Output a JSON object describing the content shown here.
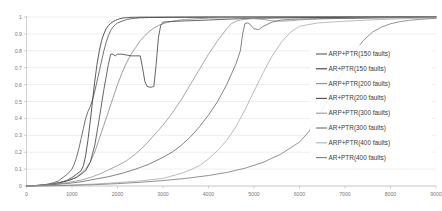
{
  "chart_data": {
    "type": "line",
    "title": "",
    "xlabel": "",
    "ylabel": "",
    "xlim": [
      0,
      9000
    ],
    "ylim": [
      0,
      1
    ],
    "grid": true,
    "legend_position": "right-inside",
    "xticks": [
      0,
      1000,
      2000,
      3000,
      4000,
      5000,
      6000,
      7000,
      8000,
      9000
    ],
    "xtick_labels": [
      "0",
      "1000",
      "2000",
      "3000",
      "4000",
      "5000",
      "6000",
      "7000",
      "8000",
      "9000"
    ],
    "yticks": [
      0,
      0.1,
      0.2,
      0.3,
      0.4,
      0.5,
      0.6,
      0.7,
      0.8,
      0.9,
      1
    ],
    "ytick_labels": [
      "0",
      "0.1",
      "0.2",
      "0.3",
      "0.4",
      "0.5",
      "0.6",
      "0.7",
      "0.8",
      "0.9",
      "1"
    ],
    "series": [
      {
        "name": "ARP+PTR(150 faults)",
        "color": "#5a5a5a",
        "x": [
          0,
          150,
          300,
          450,
          600,
          700,
          800,
          900,
          1000,
          1050,
          1100,
          1150,
          1200,
          1250,
          1300,
          1350,
          1400,
          1450,
          1500,
          1550,
          1600,
          1650,
          1700,
          1750,
          1800,
          1850,
          1900,
          1950,
          2000,
          2100,
          2200,
          2300,
          2400,
          2500,
          2600,
          2700,
          2800,
          3000,
          3500,
          4000,
          4500,
          5000,
          6000,
          7000,
          8000,
          9000
        ],
        "y": [
          0,
          0.002,
          0.005,
          0.01,
          0.02,
          0.03,
          0.05,
          0.07,
          0.1,
          0.13,
          0.17,
          0.22,
          0.28,
          0.34,
          0.4,
          0.44,
          0.47,
          0.51,
          0.56,
          0.62,
          0.68,
          0.74,
          0.8,
          0.85,
          0.89,
          0.92,
          0.94,
          0.955,
          0.965,
          0.975,
          0.985,
          0.99,
          0.993,
          0.995,
          0.996,
          0.997,
          0.997,
          0.998,
          0.998,
          0.999,
          0.999,
          0.999,
          1,
          1,
          1,
          1
        ]
      },
      {
        "name": "AR+PTR(150 faults)",
        "color": "#3c3c3c",
        "x": [
          0,
          200,
          400,
          600,
          800,
          900,
          1000,
          1100,
          1200,
          1250,
          1300,
          1350,
          1400,
          1450,
          1500,
          1550,
          1600,
          1650,
          1700,
          1750,
          1800,
          1850,
          1900,
          1950,
          2000,
          2050,
          2100,
          2150,
          2200,
          2250,
          2300,
          2350,
          2400,
          2500,
          2600,
          2700,
          2800,
          3000,
          3500,
          4000,
          4500,
          5000,
          6000,
          7000,
          8000,
          9000
        ],
        "y": [
          0,
          0.002,
          0.006,
          0.012,
          0.025,
          0.035,
          0.05,
          0.07,
          0.09,
          0.12,
          0.18,
          0.27,
          0.38,
          0.5,
          0.62,
          0.72,
          0.8,
          0.86,
          0.9,
          0.93,
          0.95,
          0.962,
          0.972,
          0.98,
          0.985,
          0.99,
          0.993,
          0.995,
          0.996,
          0.997,
          0.998,
          0.998,
          0.998,
          0.999,
          0.999,
          0.999,
          0.999,
          0.999,
          1,
          1,
          1,
          1,
          1,
          1,
          1,
          1
        ]
      },
      {
        "name": "ARP+PTR(200 faults)",
        "color": "#8e8e8e",
        "x": [
          0,
          200,
          400,
          600,
          800,
          1000,
          1100,
          1200,
          1300,
          1400,
          1500,
          1600,
          1700,
          1800,
          1900,
          2000,
          2100,
          2200,
          2300,
          2400,
          2500,
          2600,
          2700,
          2800,
          2900,
          3000,
          3100,
          3200,
          3300,
          3400,
          3500,
          4000,
          4500,
          5000,
          6000,
          7000,
          8000,
          9000
        ],
        "y": [
          0,
          0.003,
          0.008,
          0.015,
          0.025,
          0.04,
          0.055,
          0.075,
          0.1,
          0.14,
          0.2,
          0.28,
          0.36,
          0.44,
          0.52,
          0.6,
          0.67,
          0.73,
          0.78,
          0.82,
          0.86,
          0.89,
          0.915,
          0.935,
          0.95,
          0.96,
          0.968,
          0.974,
          0.979,
          0.983,
          0.986,
          0.993,
          0.996,
          0.997,
          0.998,
          0.999,
          0.999,
          1
        ]
      },
      {
        "name": "AR+PTR(200 faults)",
        "color": "#4a4a4a",
        "x": [
          0,
          300,
          600,
          900,
          1100,
          1300,
          1400,
          1500,
          1600,
          1700,
          1800,
          1850,
          1900,
          1950,
          2000,
          2100,
          2200,
          2300,
          2400,
          2500,
          2550,
          2600,
          2650,
          2700,
          2750,
          2800,
          2850,
          2900,
          2950,
          3000,
          3100,
          3200,
          3300,
          3500,
          4000,
          4500,
          5000,
          6000,
          7000,
          8000,
          9000
        ],
        "y": [
          0,
          0.004,
          0.012,
          0.03,
          0.05,
          0.09,
          0.14,
          0.24,
          0.4,
          0.57,
          0.72,
          0.78,
          0.78,
          0.77,
          0.78,
          0.78,
          0.775,
          0.77,
          0.77,
          0.77,
          0.7,
          0.62,
          0.59,
          0.585,
          0.585,
          0.59,
          0.72,
          0.88,
          0.95,
          0.97,
          0.972,
          0.974,
          0.975,
          0.977,
          0.982,
          0.988,
          0.992,
          0.996,
          0.998,
          0.999,
          1
        ]
      },
      {
        "name": "ARP+PTR(300 faults)",
        "color": "#9a9a9a",
        "x": [
          0,
          300,
          600,
          900,
          1200,
          1400,
          1600,
          1800,
          2000,
          2200,
          2400,
          2600,
          2800,
          3000,
          3200,
          3400,
          3600,
          3800,
          4000,
          4200,
          4400,
          4500,
          4600,
          4700,
          4800,
          4900,
          5000,
          5200,
          5400,
          5600,
          5800,
          6000,
          6200,
          6400,
          6600,
          6800,
          7000,
          7400,
          7800,
          8200,
          8600,
          9000
        ],
        "y": [
          0,
          0.004,
          0.01,
          0.02,
          0.035,
          0.05,
          0.07,
          0.095,
          0.12,
          0.15,
          0.19,
          0.24,
          0.3,
          0.36,
          0.43,
          0.51,
          0.6,
          0.69,
          0.78,
          0.86,
          0.93,
          0.96,
          0.975,
          0.982,
          0.986,
          0.989,
          0.99,
          0.985,
          0.978,
          0.975,
          0.978,
          0.983,
          0.986,
          0.988,
          0.99,
          0.991,
          0.992,
          0.994,
          0.996,
          0.997,
          0.998,
          0.999
        ]
      },
      {
        "name": "AR+PTR(300 faults)",
        "color": "#6e6e6e",
        "x": [
          0,
          300,
          600,
          900,
          1200,
          1500,
          1800,
          2100,
          2400,
          2700,
          3000,
          3200,
          3400,
          3600,
          3800,
          4000,
          4200,
          4400,
          4600,
          4700,
          4750,
          4800,
          4850,
          4900,
          5000,
          5100,
          5200,
          5400,
          5600,
          5800,
          6000,
          6400,
          6800,
          7200,
          7600,
          8000,
          8400,
          8800,
          9000
        ],
        "y": [
          0,
          0.003,
          0.008,
          0.015,
          0.025,
          0.04,
          0.055,
          0.075,
          0.1,
          0.13,
          0.17,
          0.2,
          0.24,
          0.29,
          0.35,
          0.42,
          0.5,
          0.6,
          0.72,
          0.8,
          0.9,
          0.96,
          0.965,
          0.96,
          0.93,
          0.925,
          0.945,
          0.97,
          0.982,
          0.986,
          0.988,
          0.99,
          0.991,
          0.992,
          0.994,
          0.995,
          0.996,
          0.997,
          0.998
        ]
      },
      {
        "name": "ARP+PTR(400 faults)",
        "color": "#b0b0b0",
        "x": [
          0,
          500,
          1000,
          1500,
          2000,
          2500,
          3000,
          3200,
          3400,
          3600,
          3800,
          4000,
          4200,
          4400,
          4600,
          4800,
          5000,
          5200,
          5400,
          5600,
          5800,
          6000,
          6400,
          6800,
          7200,
          7600,
          8000,
          8400,
          8800,
          9000
        ],
        "y": [
          0,
          0.002,
          0.006,
          0.012,
          0.02,
          0.03,
          0.045,
          0.06,
          0.075,
          0.095,
          0.12,
          0.16,
          0.21,
          0.27,
          0.35,
          0.45,
          0.56,
          0.67,
          0.77,
          0.85,
          0.91,
          0.945,
          0.965,
          0.972,
          0.978,
          0.983,
          0.987,
          0.991,
          0.994,
          0.995
        ]
      },
      {
        "name": "AR+PTR(400 faults)",
        "color": "#808080",
        "x": [
          0,
          500,
          1000,
          1500,
          2000,
          2500,
          3000,
          3500,
          4000,
          4400,
          4800,
          5200,
          5600,
          6000,
          6200,
          6400,
          6600,
          6800,
          7000,
          7200,
          7400,
          7600,
          7800,
          8000,
          8200,
          8400,
          8600,
          8800,
          9000
        ],
        "y": [
          0,
          0.001,
          0.004,
          0.008,
          0.014,
          0.022,
          0.032,
          0.045,
          0.062,
          0.08,
          0.105,
          0.14,
          0.19,
          0.26,
          0.32,
          0.4,
          0.5,
          0.6,
          0.7,
          0.79,
          0.86,
          0.91,
          0.94,
          0.96,
          0.972,
          0.98,
          0.985,
          0.989,
          0.992
        ]
      }
    ]
  },
  "legend": {
    "entries": [
      {
        "label": "ARP+PTR(150 faults)"
      },
      {
        "label": "AR+PTR(150 faults)"
      },
      {
        "label": "ARP+PTR(200 faults)"
      },
      {
        "label": "AR+PTR(200 faults)"
      },
      {
        "label": "ARP+PTR(300 faults)"
      },
      {
        "label": "AR+PTR(300 faults)"
      },
      {
        "label": "ARP+PTR(400 faults)"
      },
      {
        "label": "AR+PTR(400 faults)"
      }
    ]
  }
}
